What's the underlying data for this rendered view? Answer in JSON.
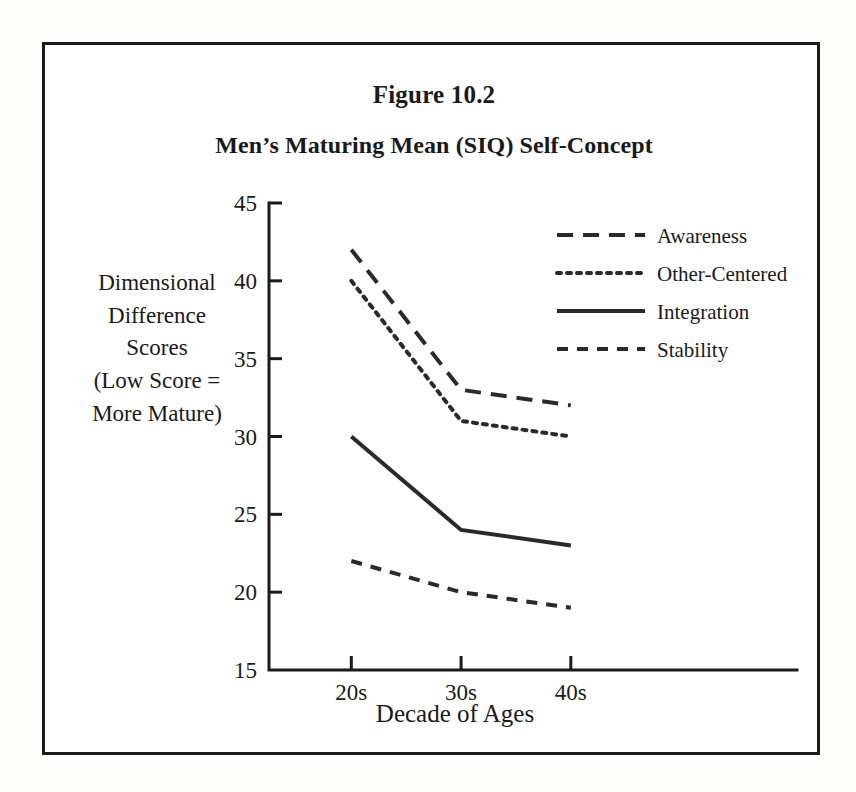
{
  "figure": {
    "title": "Figure 10.2",
    "subtitle": "Men’s Maturing Mean (SIQ) Self-Concept",
    "y_caption_lines": [
      "Dimensional",
      "Difference",
      "Scores",
      "(Low Score =",
      "More Mature)"
    ],
    "x_caption": "Decade of Ages",
    "frame_color": "#1b1b1b",
    "ink_color": "#2a2a2a",
    "background": "#fefefe"
  },
  "chart_data": {
    "type": "line",
    "title": "Figure 10.2",
    "subtitle": "Men’s Maturing Mean (SIQ) Self-Concept",
    "xlabel": "Decade of Ages",
    "ylabel": "Dimensional Difference Scores (Low Score = More Mature)",
    "categories": [
      "20s",
      "30s",
      "40s"
    ],
    "ylim": [
      15,
      45
    ],
    "yticks": [
      15,
      20,
      25,
      30,
      35,
      40,
      45
    ],
    "ytick_labels": [
      "15",
      "20",
      "25",
      "30",
      "35",
      "40",
      "45"
    ],
    "grid": false,
    "legend_position": "top-right",
    "series": [
      {
        "name": "Awareness",
        "values": [
          42,
          33,
          32
        ],
        "style": "long-dash",
        "dasharray": "16 10",
        "width": 4
      },
      {
        "name": "Other-Centered",
        "values": [
          40,
          31,
          30
        ],
        "style": "dotted",
        "dasharray": "4 6",
        "width": 4
      },
      {
        "name": "Integration",
        "values": [
          30,
          24,
          23
        ],
        "style": "solid",
        "dasharray": "none",
        "width": 4
      },
      {
        "name": "Stability",
        "values": [
          22,
          20,
          19
        ],
        "style": "dashed",
        "dasharray": "11 9",
        "width": 4
      }
    ]
  }
}
